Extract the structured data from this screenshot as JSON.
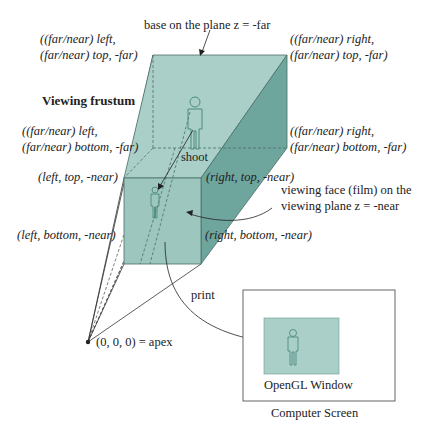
{
  "title": "Viewing frustum",
  "labels": {
    "base_plane": "base on the plane z = -far",
    "far_left_top_1": "((far/near) left,",
    "far_left_top_2": "(far/near) top, -far)",
    "far_right_top_1": "((far/near) right,",
    "far_right_top_2": "(far/near) top, -far)",
    "far_left_bottom_1": "((far/near) left,",
    "far_left_bottom_2": "(far/near) bottom, -far)",
    "far_right_bottom_1": "((far/near) right,",
    "far_right_bottom_2": "(far/near) bottom, -far)",
    "near_left_top": "(left, top, -near)",
    "near_right_top": "(right, top, -near)",
    "near_left_bottom": "(left, bottom, -near)",
    "near_right_bottom": "(right, bottom, -near)",
    "viewing_face_1": "viewing face (film) on the",
    "viewing_face_2": "viewing plane z = -near",
    "shoot": "shoot",
    "print": "print",
    "apex": "(0, 0, 0) = apex",
    "opengl_window": "OpenGL Window",
    "computer_screen": "Computer Screen"
  },
  "colors": {
    "frustum_fill": "#a9cfc8",
    "frustum_side": "#6ea59c",
    "near_face": "#9cc6be",
    "stroke": "#4a6f68",
    "figure": "#4f8a80"
  }
}
